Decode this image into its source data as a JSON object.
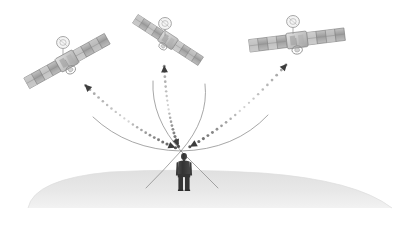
{
  "scene": {
    "title": "GNSS satellite signal reception diagram",
    "description": "Three navigation satellites transmitting dotted signal paths down to a single person standing on a curved earth surface",
    "width": 407,
    "height": 226,
    "background_color": "#ffffff"
  },
  "colors": {
    "background": "#ffffff",
    "ground_fill": "#e3e3e3",
    "ground_fill_light": "#ececec",
    "person_body": "#3a3a3a",
    "person_dark": "#2e2e2e",
    "signal_dot_dark": "#4a4a4a",
    "signal_dot_mid": "#9a9a9a",
    "signal_dot_light": "#d8d8d8",
    "arrowhead": "#3c3c3c",
    "cone_line": "#8a8a8a",
    "panel_dark": "#8e8e8e",
    "panel_mid": "#b4b4b4",
    "panel_light": "#d6d6d6",
    "panel_edge": "#6f6f6f",
    "satellite_body": "#c9c9c9",
    "satellite_body_edge": "#8a8a8a",
    "dish_outline": "#9a9a9a"
  },
  "ground": {
    "label": "earth-surface",
    "left_x": 28,
    "right_x": 392,
    "apex_y": 170,
    "bottom_y": 208
  },
  "person": {
    "label": "person-receiver",
    "x": 184,
    "head_y": 154,
    "feet_y": 190,
    "height": 36
  },
  "receiver_point": {
    "label": "signal-convergence-point",
    "x": 181,
    "y": 152
  },
  "satellites": [
    {
      "id": "satellite-left",
      "label": "Satellite 1",
      "center_x": 67,
      "center_y": 61,
      "rotation_deg": -29,
      "panel_span": 92,
      "panel_height": 13,
      "dish_offset_x": -4,
      "dish_offset_y": -13,
      "signal_target_x": 79,
      "signal_target_y": 79
    },
    {
      "id": "satellite-center",
      "label": "Satellite 2",
      "center_x": 168,
      "center_y": 40,
      "rotation_deg": 33,
      "panel_span": 78,
      "panel_height": 12,
      "dish_offset_x": -3,
      "dish_offset_y": -11,
      "signal_target_x": 163,
      "signal_target_y": 59
    },
    {
      "id": "satellite-right",
      "label": "Satellite 3",
      "center_x": 297,
      "center_y": 40,
      "rotation_deg": -7,
      "panel_span": 96,
      "panel_height": 12,
      "dish_offset_x": -4,
      "dish_offset_y": -13,
      "signal_target_x": 293,
      "signal_target_y": 57
    }
  ],
  "signal_paths": [
    {
      "id": "signal-path-left",
      "from": "satellite-left",
      "to": "receiver",
      "arrow_direction": "both",
      "dot_count": 22,
      "start_x": 181,
      "start_y": 150,
      "ctrl_x": 131,
      "ctrl_y": 131,
      "end_x": 80,
      "end_y": 80
    },
    {
      "id": "signal-path-center",
      "from": "satellite-center",
      "to": "receiver",
      "arrow_direction": "both",
      "dot_count": 20,
      "start_x": 180,
      "start_y": 150,
      "ctrl_x": 166,
      "ctrl_y": 118,
      "end_x": 164,
      "end_y": 60
    },
    {
      "id": "signal-path-right",
      "from": "satellite-right",
      "to": "receiver",
      "arrow_direction": "both",
      "dot_count": 22,
      "start_x": 184,
      "start_y": 150,
      "ctrl_x": 237,
      "ctrl_y": 122,
      "end_x": 292,
      "end_y": 58
    }
  ],
  "cone_lines": [
    {
      "id": "cone-line-far-left",
      "start_x": 181,
      "start_y": 151,
      "ctrl_x": 128,
      "ctrl_y": 150,
      "end_x": 93,
      "end_y": 117
    },
    {
      "id": "cone-line-inner-left",
      "start_x": 181,
      "start_y": 151,
      "ctrl_x": 151,
      "ctrl_y": 118,
      "end_x": 153,
      "end_y": 81
    },
    {
      "id": "cone-line-inner-right",
      "start_x": 181,
      "start_y": 151,
      "ctrl_x": 209,
      "ctrl_y": 119,
      "end_x": 205,
      "end_y": 84
    },
    {
      "id": "cone-line-far-right",
      "start_x": 181,
      "start_y": 151,
      "ctrl_x": 235,
      "ctrl_y": 150,
      "end_x": 268,
      "end_y": 115
    },
    {
      "id": "cone-line-down-left",
      "start_x": 181,
      "start_y": 151,
      "ctrl_x": 163,
      "ctrl_y": 171,
      "end_x": 146,
      "end_y": 188
    },
    {
      "id": "cone-line-down-right",
      "start_x": 181,
      "start_y": 151,
      "ctrl_x": 201,
      "ctrl_y": 171,
      "end_x": 218,
      "end_y": 188
    }
  ]
}
